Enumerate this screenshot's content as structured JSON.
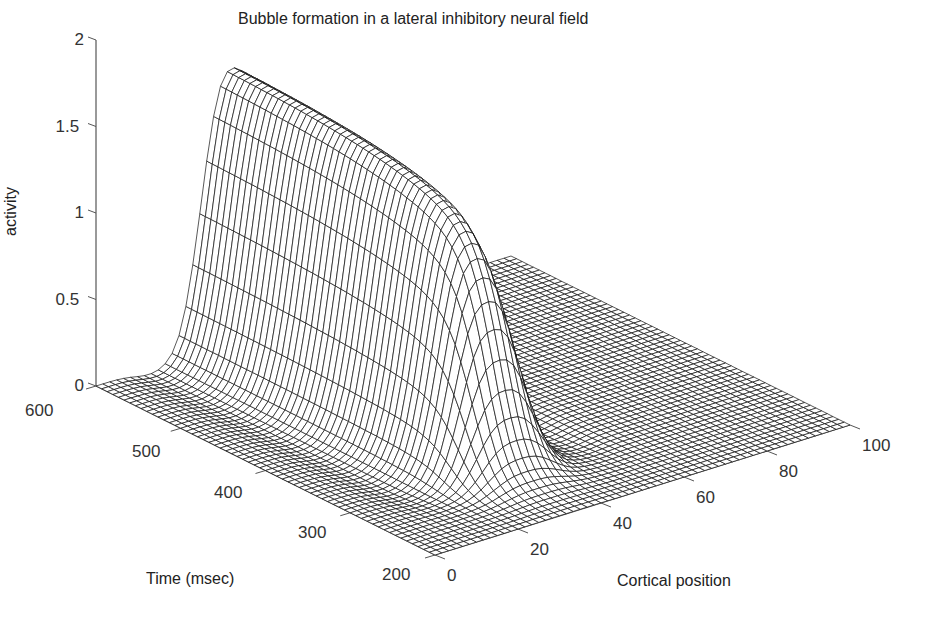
{
  "chart_data": {
    "type": "surface3d",
    "title": "Bubble formation in a lateral inhibitory neural field",
    "xlabel": "Cortical position",
    "ylabel": "Time (msec)",
    "zlabel": "activity",
    "x_ticks": [
      "0",
      "20",
      "40",
      "60",
      "80",
      "100"
    ],
    "y_ticks": [
      "200",
      "300",
      "400",
      "500",
      "600"
    ],
    "z_ticks": [
      "0",
      "0.5",
      "1",
      "1.5",
      "2"
    ],
    "xlim": [
      0,
      100
    ],
    "ylim": [
      200,
      600
    ],
    "zlim": [
      0,
      2
    ],
    "grid": false,
    "surface": {
      "description": "Mesh surface: activity near 0 everywhere except a localized bubble centred at cortical position ~33 (width ~15) that emerges around t~260 msec and grows to a plateau of ~1.6 that persists until 600 msec. A slight negative trough (lateral inhibition) lines the bubble edges.",
      "bubble_center_x": 33,
      "bubble_width": 15,
      "onset_time": 260,
      "peak_activity": 1.6,
      "x_samples": 60,
      "t_samples": 60
    },
    "profile_at_600ms": {
      "x": [
        0,
        10,
        15,
        20,
        25,
        30,
        33,
        36,
        40,
        45,
        50,
        55,
        60,
        80,
        100
      ],
      "activity": [
        0,
        0,
        0.05,
        0.5,
        1.2,
        1.55,
        1.6,
        1.55,
        1.3,
        0.7,
        0.15,
        0,
        0,
        0,
        0
      ]
    },
    "peak_vs_time": {
      "t": [
        200,
        250,
        280,
        300,
        350,
        400,
        450,
        500,
        550,
        600
      ],
      "activity": [
        0,
        0.02,
        0.4,
        0.9,
        1.3,
        1.45,
        1.52,
        1.56,
        1.59,
        1.6
      ]
    },
    "colors": {
      "mesh": "#111111",
      "axis": "#555555",
      "background": "#ffffff"
    }
  },
  "labels": {
    "title": "Bubble formation in a lateral inhibitory neural field",
    "zlabel": "activity",
    "ylabel": "Time (msec)",
    "xlabel": "Cortical position"
  }
}
